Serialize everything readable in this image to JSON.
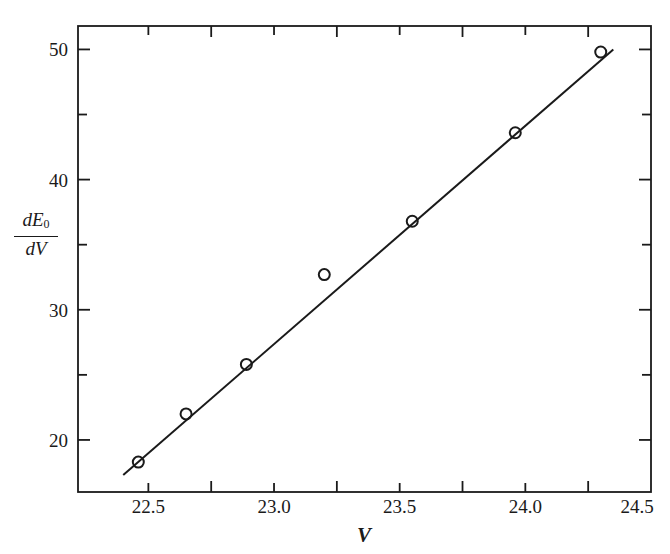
{
  "chart_data": {
    "type": "scatter",
    "title": "",
    "xlabel": "V",
    "ylabel": "dE0/dV",
    "ylabel_parts": {
      "numerator": "dE",
      "subscript": "0",
      "denominator": "dV"
    },
    "xlim": [
      22.22,
      24.5
    ],
    "ylim": [
      16,
      51.8
    ],
    "x_ticks_major": [
      22.5,
      23.0,
      23.5,
      24.0,
      24.5
    ],
    "x_tick_labels": [
      "22.5",
      "23.0",
      "23.5",
      "24.0",
      "24.5"
    ],
    "x_ticks_minor": [
      22.75,
      23.25,
      23.75,
      24.25
    ],
    "y_ticks_major": [
      20,
      30,
      40,
      50
    ],
    "y_tick_labels": [
      "20",
      "30",
      "40",
      "50"
    ],
    "y_ticks_minor": [
      25,
      35,
      45
    ],
    "grid": false,
    "legend": null,
    "series": [
      {
        "name": "measured",
        "marker": "open-circle",
        "x": [
          22.46,
          22.65,
          22.89,
          23.2,
          23.55,
          23.96,
          24.3
        ],
        "y": [
          18.3,
          22.0,
          25.8,
          32.7,
          36.8,
          43.6,
          49.8
        ]
      },
      {
        "name": "linear fit",
        "marker": "line",
        "x": [
          22.4,
          24.35
        ],
        "y": [
          17.3,
          50.0
        ]
      }
    ]
  },
  "colors": {
    "ink": "#1a1a1a",
    "background": "#ffffff"
  }
}
